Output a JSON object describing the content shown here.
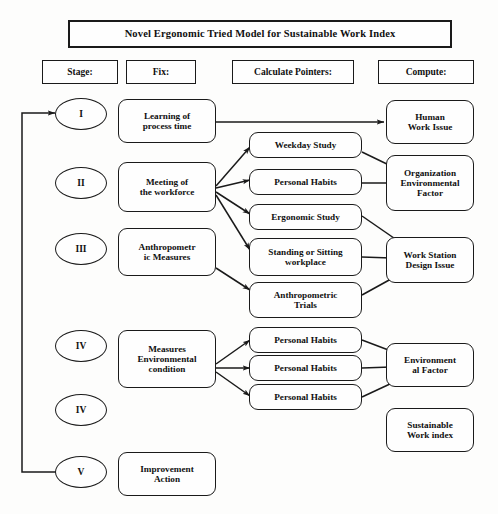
{
  "diagram": {
    "title": "Novel Ergonomic Tried Model for Sustainable Work Index",
    "headers": [
      {
        "label": "Stage:"
      },
      {
        "label": "Fix:"
      },
      {
        "label": "Calculate Pointers:"
      },
      {
        "label": "Compute:"
      }
    ],
    "stages": [
      {
        "label": "I"
      },
      {
        "label": "II"
      },
      {
        "label": "III"
      },
      {
        "label": "IV"
      },
      {
        "label": "IV"
      },
      {
        "label": "V"
      }
    ],
    "fix_nodes": [
      {
        "label": "Learning of\nprocess time"
      },
      {
        "label": "Meeting of\nthe workforce"
      },
      {
        "label": "Anthropometr\nic Measures"
      },
      {
        "label": "Measures\nEnvironmental\ncondition"
      },
      {
        "label": "Improvement\nAction"
      }
    ],
    "pointer_nodes": [
      {
        "label": "Weekday Study"
      },
      {
        "label": "Personal Habits"
      },
      {
        "label": "Ergonomic Study"
      },
      {
        "label": "Standing or Sitting\nworkplace"
      },
      {
        "label": "Anthropometric\nTrials"
      },
      {
        "label": "Personal Habits"
      },
      {
        "label": "Personal Habits"
      },
      {
        "label": "Personal Habits"
      }
    ],
    "compute_nodes": [
      {
        "label": "Human\nWork Issue"
      },
      {
        "label": "Organization\nEnvironmental\nFactor"
      },
      {
        "label": "Work Station\nDesign Issue"
      },
      {
        "label": "Environment\nal Factor"
      },
      {
        "label": "Sustainable\nWork index"
      }
    ],
    "colors": {
      "stroke": "#1a1a1a",
      "background": "#fdfdfc",
      "text": "#101010"
    }
  }
}
